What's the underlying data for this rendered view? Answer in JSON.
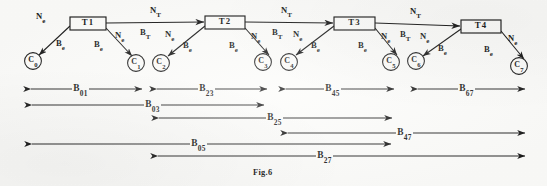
{
  "figure": {
    "caption": "Fig.6",
    "caption_main": "Fig",
    "caption_sub": ".6",
    "width": 547,
    "height": 186,
    "ink_color": "#1b1b1b",
    "paper_color": "#fcfcfa"
  },
  "labels": {
    "node_transfer": "N",
    "node_transfer_sub": "T",
    "bandwidth_transfer": "B",
    "bandwidth_transfer_sub": "T",
    "node_edge": "N",
    "node_edge_sub": "e",
    "bandwidth_edge": "B",
    "bandwidth_edge_sub": "e"
  },
  "transformers": [
    {
      "id": "t1",
      "label": "T",
      "index": "1",
      "x": 70,
      "y": 17,
      "w": 36,
      "h": 13
    },
    {
      "id": "t2",
      "label": "T",
      "index": "2",
      "x": 205,
      "y": 16,
      "w": 40,
      "h": 13
    },
    {
      "id": "t3",
      "label": "T",
      "index": "3",
      "x": 334,
      "y": 17,
      "w": 41,
      "h": 13
    },
    {
      "id": "t4",
      "label": "T",
      "index": "4",
      "x": 461,
      "y": 20,
      "w": 40,
      "h": 13
    }
  ],
  "nodes": [
    {
      "id": "c0",
      "label": "C",
      "index": "0",
      "cx": 33,
      "cy": 61
    },
    {
      "id": "c1",
      "label": "C",
      "index": "1",
      "cx": 136,
      "cy": 63
    },
    {
      "id": "c2",
      "label": "C",
      "index": "2",
      "cx": 161,
      "cy": 63
    },
    {
      "id": "c3",
      "label": "C",
      "index": "3",
      "cx": 263,
      "cy": 62
    },
    {
      "id": "c4",
      "label": "C",
      "index": "4",
      "cx": 289,
      "cy": 62
    },
    {
      "id": "c5",
      "label": "C",
      "index": "5",
      "cx": 391,
      "cy": 62
    },
    {
      "id": "c6",
      "label": "C",
      "index": "6",
      "cx": 416,
      "cy": 61
    },
    {
      "id": "c7",
      "label": "C",
      "index": "7",
      "cx": 519,
      "cy": 66
    }
  ],
  "trunk_links": [
    {
      "id": "t1-t2",
      "x1": 106,
      "y1": 23,
      "x2": 205,
      "y2": 22,
      "n_label_x": 150,
      "n_label_y": 6,
      "b_label_x": 140,
      "b_label_y": 28
    },
    {
      "id": "t2-t3",
      "x1": 245,
      "y1": 22,
      "x2": 334,
      "y2": 23,
      "n_label_x": 281,
      "n_label_y": 6,
      "b_label_x": 272,
      "b_label_y": 28
    },
    {
      "id": "t3-t4",
      "x1": 375,
      "y1": 23,
      "x2": 461,
      "y2": 26,
      "n_label_x": 410,
      "n_label_y": 7,
      "b_label_x": 400,
      "b_label_y": 30
    }
  ],
  "branches": [
    {
      "id": "t1-c0",
      "x1": 70,
      "y1": 26,
      "x2": 39,
      "y2": 55,
      "ne_x": 36,
      "ne_y": 12,
      "be_x": 56,
      "be_y": 39
    },
    {
      "id": "t1-c1",
      "x1": 106,
      "y1": 28,
      "x2": 132,
      "y2": 56,
      "ne_x": 115,
      "ne_y": 31,
      "be_x": 94,
      "be_y": 40
    },
    {
      "id": "t2-c2",
      "x1": 205,
      "y1": 26,
      "x2": 168,
      "y2": 56,
      "ne_x": 165,
      "ne_y": 30,
      "be_x": 183,
      "be_y": 41
    },
    {
      "id": "t2-c3",
      "x1": 245,
      "y1": 28,
      "x2": 269,
      "y2": 55,
      "ne_x": 251,
      "ne_y": 32,
      "be_x": 229,
      "be_y": 41
    },
    {
      "id": "t3-c4",
      "x1": 334,
      "y1": 26,
      "x2": 296,
      "y2": 55,
      "ne_x": 293,
      "ne_y": 30,
      "be_x": 311,
      "be_y": 41
    },
    {
      "id": "t3-c5",
      "x1": 375,
      "y1": 28,
      "x2": 397,
      "y2": 55,
      "ne_x": 381,
      "ne_y": 32,
      "be_x": 358,
      "be_y": 41
    },
    {
      "id": "t4-c6",
      "x1": 461,
      "y1": 29,
      "x2": 423,
      "y2": 56,
      "ne_x": 420,
      "ne_y": 32,
      "be_x": 438,
      "be_y": 44
    },
    {
      "id": "t4-c7",
      "x1": 501,
      "y1": 31,
      "x2": 524,
      "y2": 59,
      "ne_x": 508,
      "ne_y": 34,
      "be_x": 484,
      "be_y": 45
    }
  ],
  "span_arrows": [
    {
      "id": "b01",
      "label": "B",
      "index": "01",
      "x1": 30,
      "x2": 143,
      "y": 89,
      "label_x": 72,
      "dir": "both"
    },
    {
      "id": "b23",
      "label": "B",
      "index": "23",
      "x1": 156,
      "x2": 268,
      "y": 89,
      "label_x": 198,
      "dir": "both"
    },
    {
      "id": "b45",
      "label": "B",
      "index": "45",
      "x1": 285,
      "x2": 395,
      "y": 89,
      "label_x": 324,
      "dir": "both"
    },
    {
      "id": "b67",
      "label": "B",
      "index": "67",
      "x1": 417,
      "x2": 526,
      "y": 89,
      "label_x": 458,
      "dir": "both"
    },
    {
      "id": "b03",
      "label": "B",
      "index": "03",
      "x1": 31,
      "x2": 265,
      "y": 105,
      "label_x": 144,
      "dir": "both"
    },
    {
      "id": "b25",
      "label": "B",
      "index": "25",
      "x1": 158,
      "x2": 393,
      "y": 118,
      "label_x": 266,
      "dir": "both"
    },
    {
      "id": "b47",
      "label": "B",
      "index": "47",
      "x1": 287,
      "x2": 526,
      "y": 133,
      "label_x": 396,
      "dir": "both"
    },
    {
      "id": "b05",
      "label": "B",
      "index": "05",
      "x1": 31,
      "x2": 392,
      "y": 144,
      "label_x": 190,
      "dir": "both"
    },
    {
      "id": "b27",
      "label": "B",
      "index": "27",
      "x1": 157,
      "x2": 526,
      "y": 156,
      "label_x": 316,
      "dir": "both"
    }
  ],
  "caption_position": {
    "x": 253,
    "y": 168
  }
}
